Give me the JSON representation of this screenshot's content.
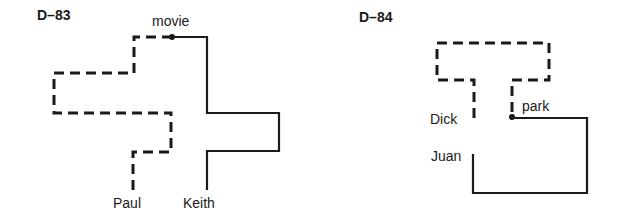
{
  "diagrams": [
    {
      "id": "D–83",
      "title": "D–83",
      "labels": {
        "top": "movie",
        "dashed_end": "Paul",
        "solid_end": "Keith"
      }
    },
    {
      "id": "D–84",
      "title": "D–84",
      "labels": {
        "junction": "park",
        "dashed_end": "Dick",
        "solid_end": "Juan"
      }
    }
  ],
  "colors": {
    "stroke": "#1a1a1a",
    "background": "#ffffff"
  }
}
